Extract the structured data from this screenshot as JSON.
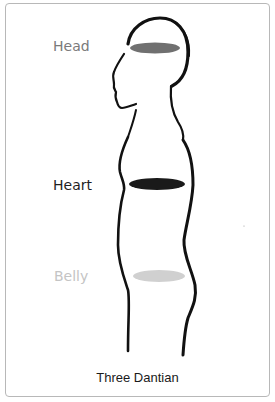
{
  "diagram": {
    "caption": "Three Dantian",
    "centers": [
      {
        "id": "head",
        "label": "Head",
        "label_color": "#7a7a7a",
        "ellipse_color": "#707070"
      },
      {
        "id": "heart",
        "label": "Heart",
        "label_color": "#1f1f1f",
        "ellipse_color": "#1a1a1a"
      },
      {
        "id": "belly",
        "label": "Belly",
        "label_color": "#c4c4c4",
        "ellipse_color": "#d0d0d0"
      }
    ],
    "outline_color": "#111111",
    "frame_border_color": "#b8b8b8"
  }
}
